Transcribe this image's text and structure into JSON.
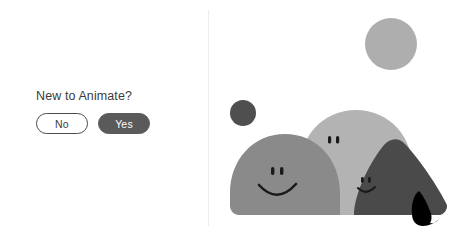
{
  "left_panel": {
    "prompt": {
      "title": "New to Animate?",
      "options": [
        {
          "label": "No",
          "selected": false
        },
        {
          "label": "Yes",
          "selected": true
        }
      ]
    }
  },
  "divider": {
    "color": "#ececec"
  },
  "illustration": {
    "description": "Three smiling blob characters with two floating circles",
    "background": "#ffffff",
    "shapes": [
      {
        "name": "small-circle-accent",
        "type": "circle",
        "color": "#aeaeae",
        "cx": 182,
        "cy": 44,
        "r": 26
      },
      {
        "name": "small-circle-dark",
        "type": "circle",
        "color": "#4f4f4f",
        "cx": 34,
        "cy": 113,
        "r": 13
      },
      {
        "name": "blob-back-light",
        "type": "blob",
        "color": "#b3b3b3",
        "face": "eyes-only"
      },
      {
        "name": "blob-front-mid",
        "type": "blob",
        "color": "#8a8a8a",
        "face": "smile"
      },
      {
        "name": "blob-right-dark",
        "type": "blob",
        "color": "#4a4a4a",
        "face": "smile"
      },
      {
        "name": "blob-tail",
        "type": "tail",
        "color": "#000000"
      }
    ],
    "colors": {
      "light_gray": "#b3b3b3",
      "mid_gray": "#8a8a8a",
      "dark_gray": "#4a4a4a",
      "accent_circle": "#aeaeae",
      "dark_circle": "#4f4f4f",
      "tail_black": "#000000",
      "face_stroke": "#1a1a1a"
    }
  }
}
